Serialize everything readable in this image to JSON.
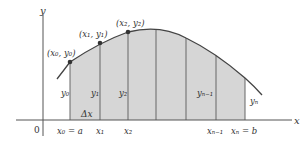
{
  "diagram": {
    "title": "",
    "axes": {
      "x_label": "x",
      "y_label": "y",
      "origin_label": "0"
    },
    "points": [
      {
        "label": "(x₀, y₀)"
      },
      {
        "label": "(x₁, y₁)"
      },
      {
        "label": "(x₂, y₂)"
      }
    ],
    "heights": [
      "y₀",
      "y₁",
      "y₂",
      "yₙ₋₁",
      "yₙ"
    ],
    "x_ticks": [
      "x₀ = a",
      "x₁",
      "x₂",
      "xₙ₋₁",
      "xₙ = b"
    ],
    "delta_label": "Δx",
    "colors": {
      "fill": "#d4d4d4",
      "stroke": "#555555",
      "curve": "#444444",
      "point": "#333333"
    }
  }
}
